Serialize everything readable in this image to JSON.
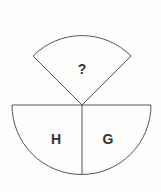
{
  "diagram": {
    "top_sector": {
      "label": "?"
    },
    "left_quadrant": {
      "label": "H"
    },
    "right_quadrant": {
      "label": "G"
    },
    "stroke_color": "#555555",
    "background": "#fdfdfb"
  }
}
